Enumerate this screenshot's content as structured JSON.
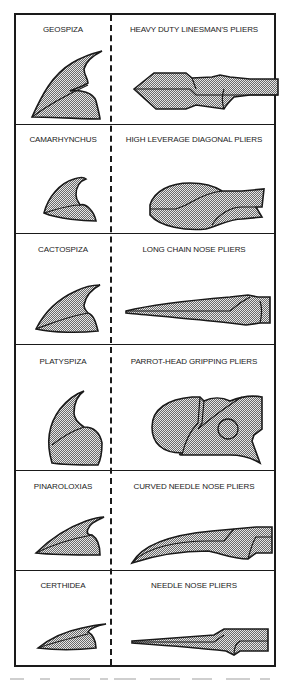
{
  "figure": {
    "pattern_fill": "#c8c8c8",
    "stroke_color": "#1a1a1a",
    "rows": [
      {
        "bird": "GEOSPIZA",
        "tool": "HEAVY DUTY LINESMAN'S PLIERS"
      },
      {
        "bird": "CAMARHYNCHUS",
        "tool": "HIGH LEVERAGE DIAGONAL PLIERS"
      },
      {
        "bird": "CACTOSPIZA",
        "tool": "LONG CHAIN NOSE PLIERS"
      },
      {
        "bird": "PLATYSPIZA",
        "tool": "PARROT-HEAD GRIPPING PLIERS"
      },
      {
        "bird": "PINAROLOXIAS",
        "tool": "CURVED NEEDLE NOSE PLIERS"
      },
      {
        "bird": "CERTHIDEA",
        "tool": "NEEDLE NOSE PLIERS"
      }
    ]
  }
}
